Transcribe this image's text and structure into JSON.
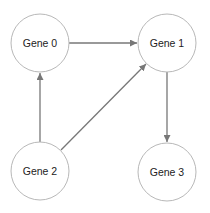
{
  "diagram": {
    "type": "directed-graph",
    "colors": {
      "node_stroke": "#b8b8b8",
      "node_fill": "#ffffff",
      "edge": "#777777",
      "text": "#222222"
    },
    "nodes": [
      {
        "id": "g0",
        "label": "Gene 0",
        "cx": 40,
        "cy": 43
      },
      {
        "id": "g1",
        "label": "Gene 1",
        "cx": 167,
        "cy": 43
      },
      {
        "id": "g2",
        "label": "Gene 2",
        "cx": 40,
        "cy": 171
      },
      {
        "id": "g3",
        "label": "Gene 3",
        "cx": 167,
        "cy": 172
      }
    ],
    "edges": [
      {
        "from": "Gene 0",
        "to": "Gene 1"
      },
      {
        "from": "Gene 1",
        "to": "Gene 3"
      },
      {
        "from": "Gene 2",
        "to": "Gene 0"
      },
      {
        "from": "Gene 2",
        "to": "Gene 1"
      }
    ]
  }
}
